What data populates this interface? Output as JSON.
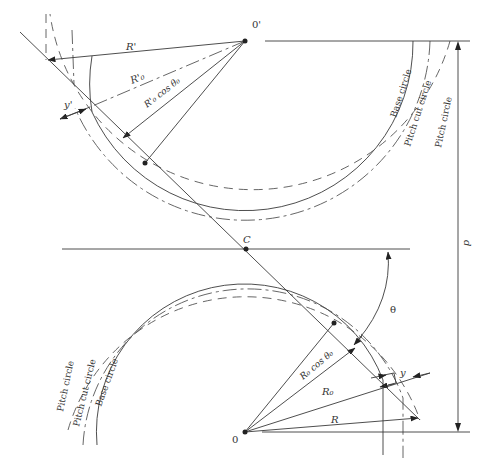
{
  "figure": {
    "points": {
      "upper_center": "0'",
      "lower_center": "0",
      "pitch_point": "C"
    },
    "upper_labels": {
      "R_prime": "R'",
      "R_prime_0": "R'₀",
      "R_prime_0_cos": "R'₀ cos θ₀",
      "y_prime": "y'"
    },
    "lower_labels": {
      "R": "R",
      "R0": "R₀",
      "R0_cos": "R₀ cos θ₀",
      "y": "y",
      "theta": "θ"
    },
    "dimension": {
      "d": "d"
    },
    "circle_labels_upper": {
      "base": "Base circle",
      "pitch_cut": "Pitch cut circle",
      "pitch": "Pitch circle"
    },
    "circle_labels_lower": {
      "base": "Base circle",
      "pitch_cut": "Pitch cut circle",
      "pitch": "Pitch circle"
    }
  }
}
